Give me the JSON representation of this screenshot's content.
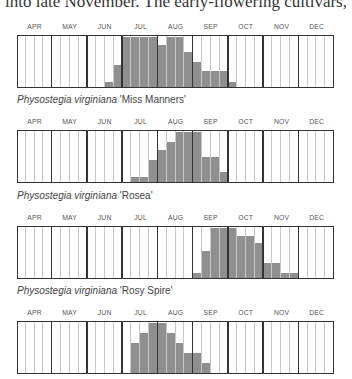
{
  "intro_text": "into late November. The early-flowering cultivars,",
  "months": [
    "APR",
    "MAY",
    "JUN",
    "JUL",
    "AUG",
    "SEP",
    "OCT",
    "NOV",
    "DEC"
  ],
  "colors": {
    "bar": "#8f8f8f",
    "border": "#333333",
    "week_line": "#c8c8c8"
  },
  "chart_data": [
    {
      "type": "bar",
      "title": "",
      "caption_species": "Physostegia virginiana",
      "caption_cultivar": "'Miss Manners'",
      "categories_months": [
        "APR",
        "MAY",
        "JUN",
        "JUL",
        "AUG",
        "SEP",
        "OCT",
        "NOV",
        "DEC"
      ],
      "weeks_per_month": 4,
      "values": [
        0,
        0,
        0,
        0,
        0,
        0,
        0,
        0,
        0,
        0,
        0.1,
        0.45,
        1,
        1,
        1,
        1,
        0.85,
        1,
        1,
        0.7,
        0.5,
        0.33,
        0.33,
        0.33,
        0.1,
        0,
        0,
        0,
        0,
        0,
        0,
        0,
        0,
        0,
        0,
        0
      ],
      "ylim": [
        0,
        1
      ]
    },
    {
      "type": "bar",
      "caption_species": "Physostegia virginiana",
      "caption_cultivar": "'Rosea'",
      "categories_months": [
        "APR",
        "MAY",
        "JUN",
        "JUL",
        "AUG",
        "SEP",
        "OCT",
        "NOV",
        "DEC"
      ],
      "weeks_per_month": 4,
      "values": [
        0,
        0,
        0,
        0,
        0,
        0,
        0,
        0,
        0,
        0,
        0,
        0,
        0,
        0.1,
        0.1,
        0.45,
        0.65,
        0.8,
        1,
        1,
        1,
        0.5,
        0.5,
        0.2,
        0,
        0,
        0,
        0,
        0,
        0,
        0,
        0,
        0,
        0,
        0,
        0
      ],
      "ylim": [
        0,
        1
      ]
    },
    {
      "type": "bar",
      "caption_species": "Physostegia virginiana",
      "caption_cultivar": "'Rosy Spire'",
      "categories_months": [
        "APR",
        "MAY",
        "JUN",
        "JUL",
        "AUG",
        "SEP",
        "OCT",
        "NOV",
        "DEC"
      ],
      "weeks_per_month": 4,
      "values": [
        0,
        0,
        0,
        0,
        0,
        0,
        0,
        0,
        0,
        0,
        0,
        0,
        0,
        0,
        0,
        0,
        0,
        0,
        0,
        0,
        0.1,
        0.55,
        1,
        1,
        1,
        0.85,
        0.85,
        0.7,
        0.3,
        0.3,
        0.1,
        0.1,
        0,
        0,
        0,
        0
      ],
      "ylim": [
        0,
        1
      ]
    },
    {
      "type": "bar",
      "caption_species": "",
      "caption_cultivar": "",
      "categories_months": [
        "APR",
        "MAY",
        "JUN",
        "JUL",
        "AUG",
        "SEP",
        "OCT",
        "NOV",
        "DEC"
      ],
      "weeks_per_month": 4,
      "values": [
        0,
        0,
        0,
        0,
        0,
        0,
        0,
        0,
        0,
        0,
        0,
        0,
        0,
        0.6,
        0.8,
        1,
        1,
        0.8,
        0.6,
        0.4,
        0.4,
        0.2,
        0,
        0,
        0,
        0,
        0,
        0,
        0,
        0,
        0,
        0,
        0,
        0,
        0,
        0
      ],
      "ylim": [
        0,
        1
      ]
    }
  ]
}
